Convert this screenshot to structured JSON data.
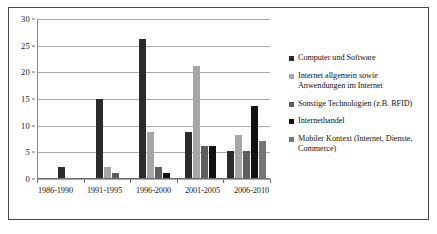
{
  "chart_data": {
    "type": "bar",
    "title": "",
    "subtitle": "",
    "xlabel": "",
    "ylabel": "",
    "categories": [
      "1986-1990",
      "1991-1995",
      "1996-2000",
      "2001-2005",
      "2006-2010"
    ],
    "series": [
      {
        "name": "Computer und Software",
        "color": "#2b2b2b",
        "values": [
          2,
          14.8,
          26,
          8.7,
          5
        ]
      },
      {
        "name": "Internet allgemein sowie Anwendungen im Internet",
        "color": "#a6a6a6",
        "values": [
          0,
          2,
          8.7,
          21,
          8
        ]
      },
      {
        "name": "Sonstige Technologien (z.B. RFID)",
        "color": "#5e5e5e",
        "values": [
          0,
          1,
          2,
          6,
          5
        ]
      },
      {
        "name": "Internethandel",
        "color": "#111111",
        "values": [
          0,
          0,
          1,
          6,
          13.5
        ]
      },
      {
        "name": "Mobiler Kontext (Internet, Dienste, Commerce)",
        "color": "#777777",
        "values": [
          0,
          0,
          0,
          0,
          7
        ]
      }
    ],
    "ylim": [
      0,
      30
    ],
    "yticks": [
      0,
      5,
      10,
      15,
      20,
      25,
      30
    ],
    "ytick_labels": [
      "0",
      "5",
      "10",
      "15",
      "20",
      "25",
      "30"
    ],
    "grid": true,
    "grid_axis": "y",
    "legend_position": "right",
    "legend": [
      "Computer und Software",
      "Internet allgemein sowie Anwendungen im Internet",
      "Sonstige Technologien (z.B. RFID)",
      "Internethandel",
      "Mobiler Kontext (Internet, Dienste, Commerce)"
    ]
  },
  "figure": {
    "border_color": "#4a4a4a",
    "background": "#ffffff",
    "gridline_color": "#a9a9a9"
  }
}
